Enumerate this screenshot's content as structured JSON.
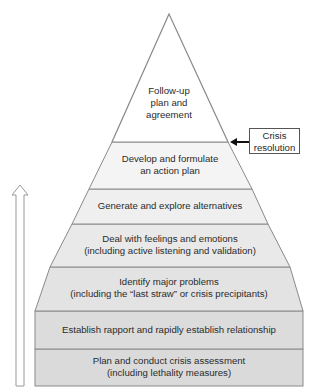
{
  "diagram": {
    "type": "pyramid",
    "levels": [
      {
        "text": "Follow-up\nplan and\nagreement",
        "lines": [
          "Follow-up",
          "plan and",
          "agreement"
        ]
      },
      {
        "lines": [
          "Develop and formulate",
          "an action plan"
        ]
      },
      {
        "lines": [
          "Generate and explore alternatives"
        ]
      },
      {
        "lines": [
          "Deal with feelings and emotions",
          "(including active listening and validation)"
        ]
      },
      {
        "lines": [
          "Identify major problems",
          "(including the “last straw” or crisis precipitants)"
        ]
      },
      {
        "lines": [
          "Establish rapport and rapidly establish relationship"
        ]
      },
      {
        "lines": [
          "Plan and conduct crisis assessment",
          "(including lethality measures)"
        ]
      }
    ],
    "callout": {
      "lines": [
        "Crisis",
        "resolution"
      ],
      "points_to": "boundary between level 1 and level 2"
    },
    "progress_arrow": {
      "direction": "up",
      "icon": "up-arrow-icon"
    },
    "colors": {
      "outline": "#8a8a8a",
      "fill_top": "#ffffff",
      "fill_mid": "#f1f1f1",
      "fill_low": "#e6e6e6",
      "fill_base": "#dcdcdc"
    }
  }
}
